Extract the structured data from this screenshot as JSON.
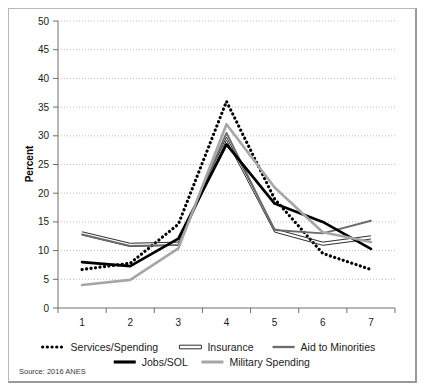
{
  "figure": {
    "source_note": "Source: 2016 ANES",
    "border_color": "#b8b8b8"
  },
  "chart_data": {
    "type": "line",
    "title": "",
    "xlabel": "",
    "ylabel": "Percent",
    "x": [
      1,
      2,
      3,
      4,
      5,
      6,
      7
    ],
    "xtick_labels": [
      "1",
      "2",
      "3",
      "4",
      "5",
      "6",
      "7"
    ],
    "ytick_labels": [
      "0",
      "5",
      "10",
      "15",
      "20",
      "25",
      "30",
      "35",
      "40",
      "45",
      "50"
    ],
    "ytick_values": [
      0,
      5,
      10,
      15,
      20,
      25,
      30,
      35,
      40,
      45,
      50
    ],
    "ylim": [
      0,
      50
    ],
    "grid": true,
    "legend_position": "bottom",
    "series": [
      {
        "name": "Services/Spending",
        "style": "dotted",
        "color": "#000000",
        "width": 2.6,
        "values": [
          6.7,
          7.8,
          14.6,
          36.0,
          19.0,
          9.5,
          6.7
        ]
      },
      {
        "name": "Insurance",
        "style": "double-thin",
        "color": "#2e2e2e",
        "width": 1.0,
        "values": [
          13.0,
          11.0,
          11.2,
          29.5,
          13.5,
          11.2,
          12.3
        ]
      },
      {
        "name": "Aid to Minorities",
        "style": "solid",
        "color": "#6b6b6b",
        "width": 1.9,
        "values": [
          12.8,
          10.8,
          11.0,
          30.5,
          13.6,
          13.0,
          15.2
        ]
      },
      {
        "name": "Jobs/SOL",
        "style": "solid",
        "color": "#000000",
        "width": 2.7,
        "values": [
          8.0,
          7.3,
          12.1,
          28.5,
          18.2,
          15.0,
          10.3
        ]
      },
      {
        "name": "Military Spending",
        "style": "solid",
        "color": "#a6a6a6",
        "width": 2.6,
        "values": [
          4.0,
          4.9,
          10.4,
          32.0,
          21.0,
          13.2,
          11.5
        ]
      }
    ]
  },
  "legend": {
    "row1": [
      {
        "label": "Services/Spending",
        "marker": "dotted-marker"
      },
      {
        "label": "Insurance",
        "marker": "double-line-marker"
      },
      {
        "label": "Aid to Minorities",
        "marker": "gray-line-marker"
      }
    ],
    "row2": [
      {
        "label": "Jobs/SOL",
        "marker": "thick-black-line-marker"
      },
      {
        "label": "Military Spending",
        "marker": "light-gray-line-marker"
      }
    ]
  }
}
